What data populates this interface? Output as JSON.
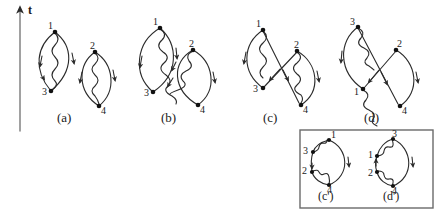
{
  "figure": {
    "axis": {
      "label": "t",
      "name": "time-axis",
      "direction": "up",
      "x": 20,
      "y_bottom": 131,
      "y_top": 6,
      "label_x": 29,
      "label_y": 5
    },
    "line_color": "#2b2b2b",
    "vertex_color": "#111111",
    "box_color": "#6a6a6a",
    "captions": [
      {
        "id": "a",
        "text": "(a)",
        "x": 57,
        "y": 110
      },
      {
        "id": "b",
        "text": "(b)",
        "x": 161,
        "y": 110
      },
      {
        "id": "c",
        "text": "(c)",
        "x": 263,
        "y": 110
      },
      {
        "id": "d",
        "text": "(d)",
        "x": 364,
        "y": 110
      },
      {
        "id": "cp",
        "text": "(c')",
        "x": 321,
        "y": 191
      },
      {
        "id": "dp",
        "text": "(d')",
        "x": 386,
        "y": 191
      }
    ],
    "inset_box": {
      "x": 300,
      "y": 130,
      "w": 133,
      "h": 78
    },
    "diagrams": [
      {
        "id": "a",
        "name": "diagram-a",
        "description": "two disconnected bubble (lens) diagrams with wavy interaction lines",
        "vertices": [
          {
            "label": "1",
            "x": 55,
            "y": 32,
            "lx": 48,
            "ly": 22
          },
          {
            "label": "3",
            "x": 51,
            "y": 91,
            "lx": 42,
            "ly": 88
          },
          {
            "label": "2",
            "x": 95,
            "y": 52,
            "lx": 90,
            "ly": 42
          },
          {
            "label": "4",
            "x": 99,
            "y": 106,
            "lx": 100,
            "ly": 104
          }
        ]
      },
      {
        "id": "b",
        "name": "diagram-b",
        "description": "two overlapping bubbles with crossing wavy interaction lines 1-4 and 2-3",
        "vertices": [
          {
            "label": "1",
            "x": 160,
            "y": 28,
            "lx": 153,
            "ly": 18
          },
          {
            "label": "3",
            "x": 153,
            "y": 92,
            "lx": 144,
            "ly": 89
          },
          {
            "label": "2",
            "x": 193,
            "y": 50,
            "lx": 190,
            "ly": 40
          },
          {
            "label": "4",
            "x": 198,
            "y": 105,
            "lx": 199,
            "ly": 103
          }
        ]
      },
      {
        "id": "c",
        "name": "diagram-c",
        "description": "two bubbles with straight crossing propagators 1-4 and 2-3",
        "vertices": [
          {
            "label": "1",
            "x": 263,
            "y": 30,
            "lx": 256,
            "ly": 20
          },
          {
            "label": "3",
            "x": 263,
            "y": 88,
            "lx": 252,
            "ly": 85
          },
          {
            "label": "2",
            "x": 297,
            "y": 51,
            "lx": 294,
            "ly": 41
          },
          {
            "label": "4",
            "x": 301,
            "y": 105,
            "lx": 302,
            "ly": 103
          }
        ]
      },
      {
        "id": "d",
        "name": "diagram-d",
        "description": "two bubbles with straight crossing propagators 3-4 and 2-1",
        "vertices": [
          {
            "label": "3",
            "x": 358,
            "y": 27,
            "lx": 350,
            "ly": 18
          },
          {
            "label": "1",
            "x": 363,
            "y": 89,
            "lx": 355,
            "ly": 92
          },
          {
            "label": "2",
            "x": 396,
            "y": 50,
            "lx": 396,
            "ly": 40
          },
          {
            "label": "4",
            "x": 400,
            "y": 106,
            "lx": 401,
            "ly": 104
          }
        ]
      },
      {
        "id": "cp",
        "name": "diagram-c-prime",
        "description": "single loop with vertices 1,3,2,4 and two short wavy lines",
        "vertices": [
          {
            "label": "1",
            "x": 329,
            "y": 140,
            "lx": 329,
            "ly": 130
          },
          {
            "label": "3",
            "x": 313,
            "y": 152,
            "lx": 303,
            "ly": 147
          },
          {
            "label": "2",
            "x": 312,
            "y": 172,
            "lx": 302,
            "ly": 168
          },
          {
            "label": "4",
            "x": 329,
            "y": 185,
            "lx": 329,
            "ly": 178
          }
        ]
      },
      {
        "id": "dp",
        "name": "diagram-d-prime",
        "description": "single loop with vertices 3,1,2,4 and two long wavy lines",
        "vertices": [
          {
            "label": "3",
            "x": 393,
            "y": 139,
            "lx": 391,
            "ly": 129
          },
          {
            "label": "1",
            "x": 377,
            "y": 156,
            "lx": 367,
            "ly": 152
          },
          {
            "label": "2",
            "x": 377,
            "y": 172,
            "lx": 367,
            "ly": 170
          },
          {
            "label": "4",
            "x": 393,
            "y": 186,
            "lx": 393,
            "ly": 180
          }
        ]
      }
    ]
  }
}
